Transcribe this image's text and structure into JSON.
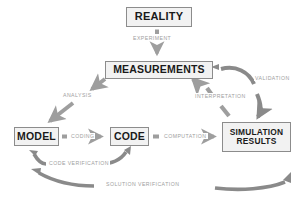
{
  "diagram": {
    "colors": {
      "arrow": "#9e9e9e",
      "arrow_dark": "#8a8a8a",
      "box_border": "#8c8c8c",
      "box_fill": "#f2f2f2",
      "box_text": "#1a1a1a",
      "label_text": "#9e9e9e",
      "background": "#ffffff"
    },
    "nodes": [
      {
        "id": "reality",
        "label": "REALITY"
      },
      {
        "id": "measurements",
        "label": "MEASUREMENTS"
      },
      {
        "id": "model",
        "label": "MODEL"
      },
      {
        "id": "code",
        "label": "CODE"
      },
      {
        "id": "simulation_results",
        "label_line1": "SIMULATION",
        "label_line2": "RESULTS"
      }
    ],
    "edges": [
      {
        "id": "experiment",
        "label": "EXPERIMENT",
        "from": "reality",
        "to": "measurements",
        "style": "straight-down"
      },
      {
        "id": "analysis",
        "label": "ANALYSIS",
        "from": "measurements",
        "to": "model",
        "style": "diagonal-down-left"
      },
      {
        "id": "coding",
        "label": "CODING",
        "from": "model",
        "to": "code",
        "style": "straight-right"
      },
      {
        "id": "computation",
        "label": "COMPUTATION",
        "from": "code",
        "to": "simulation_results",
        "style": "straight-right"
      },
      {
        "id": "interpretation",
        "label": "INTERPRETATION",
        "from": "simulation_results",
        "to": "measurements",
        "style": "diagonal-up-left"
      },
      {
        "id": "validation",
        "label": "VALIDATION",
        "from": "measurements",
        "to": "simulation_results",
        "style": "curved-right-down"
      },
      {
        "id": "code_verification",
        "label": "CODE VERIFICATION",
        "from": "code",
        "to": "model",
        "style": "curved-bidirectional"
      },
      {
        "id": "solution_verification",
        "label": "SOLUTION VERIFICATION",
        "from": "simulation_results",
        "to": "model",
        "style": "curved-bidirectional-wide"
      }
    ]
  }
}
